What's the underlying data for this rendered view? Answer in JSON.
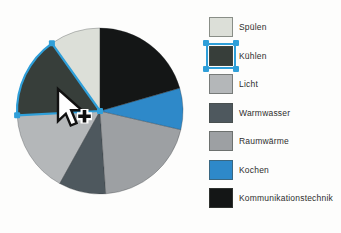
{
  "background": "#fdfdfc",
  "icons": {
    "cursor": "arrow-pointer-with-plus"
  },
  "chart_data": {
    "type": "pie",
    "title": "",
    "legend_position": "right",
    "angle_reference": "degrees clockwise from 12 o'clock",
    "pie": {
      "cx": 100,
      "cy": 111,
      "r": 83
    },
    "selection": {
      "selected_slice": "Kühlen",
      "color": "#2f9fd9"
    },
    "slices": [
      {
        "key": "spuelen",
        "label": "Spülen",
        "color": "#dcdfd8",
        "start_deg": 324.6,
        "end_deg": 360,
        "percent": 9.8,
        "selected": false
      },
      {
        "key": "kuehlen",
        "label": "Kühlen",
        "color": "#373e3a",
        "start_deg": 267,
        "end_deg": 324.6,
        "percent": 16.0,
        "selected": true
      },
      {
        "key": "licht",
        "label": "Licht",
        "color": "#b4b7b9",
        "start_deg": 209,
        "end_deg": 267,
        "percent": 16.1,
        "selected": false
      },
      {
        "key": "warmwasser",
        "label": "Warmwasser",
        "color": "#4e585e",
        "start_deg": 176,
        "end_deg": 209,
        "percent": 9.2,
        "selected": false
      },
      {
        "key": "raumwaerme",
        "label": "Raumwärme",
        "color": "#9da0a3",
        "start_deg": 103,
        "end_deg": 176,
        "percent": 20.3,
        "selected": false
      },
      {
        "key": "kochen",
        "label": "Kochen",
        "color": "#2e89c9",
        "start_deg": 74,
        "end_deg": 103,
        "percent": 8.1,
        "selected": false
      },
      {
        "key": "kommunikationstechnik",
        "label": "Kommunikationstechnik",
        "color": "#141616",
        "start_deg": 0,
        "end_deg": 74,
        "percent": 20.6,
        "selected": false
      }
    ]
  }
}
